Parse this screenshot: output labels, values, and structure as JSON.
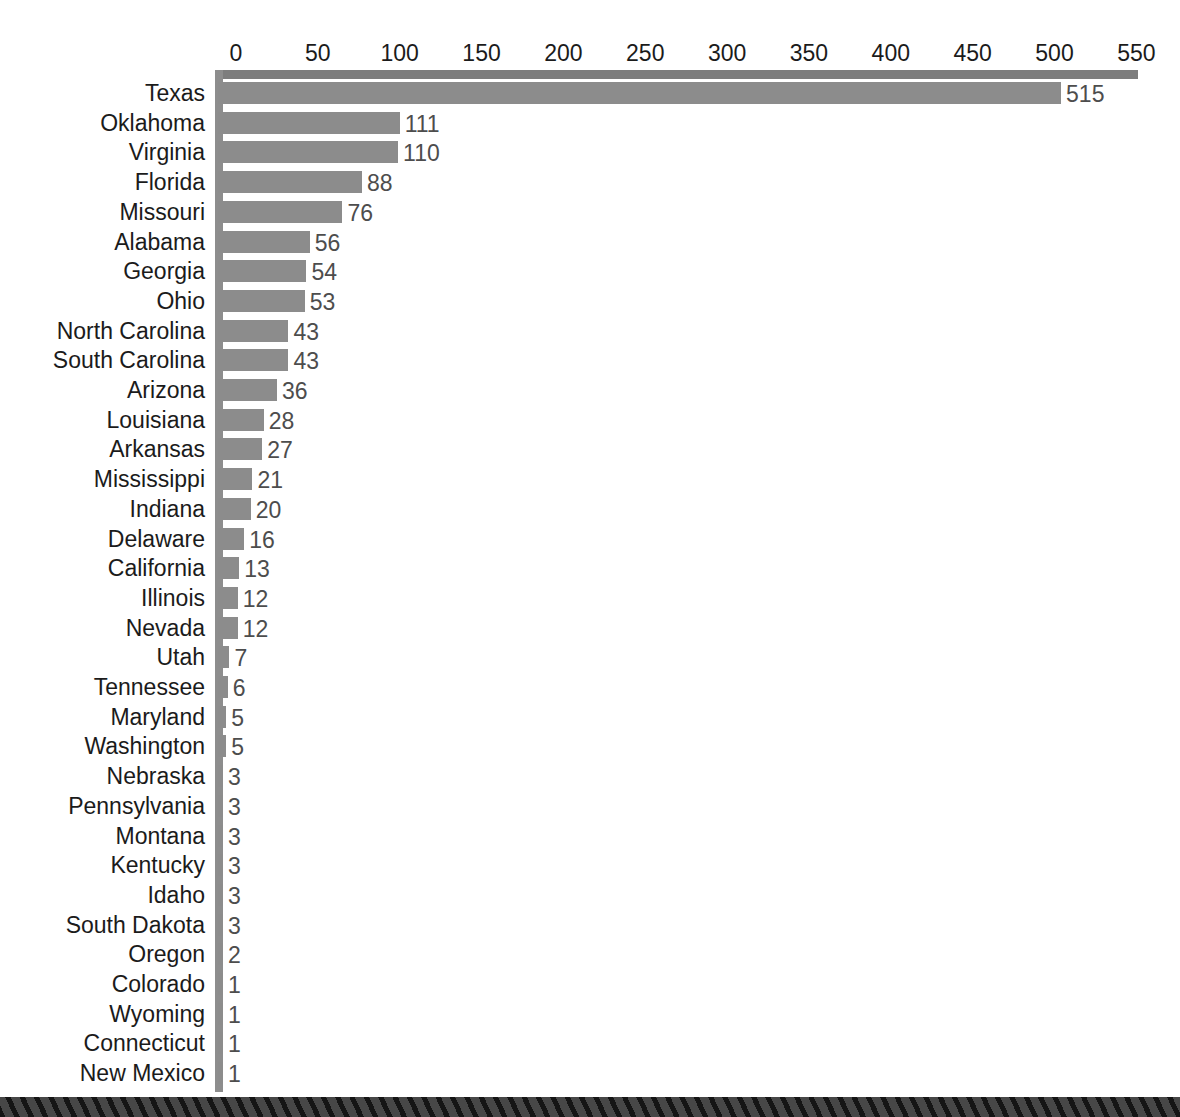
{
  "page": {
    "background_color": "#ffffff",
    "title_cropped": "",
    "footer_band_color": "#3b3b3b",
    "footer_band_stripe_color": "#151515"
  },
  "chart_data": {
    "type": "bar",
    "orientation": "horizontal",
    "title": "",
    "xlabel": "",
    "ylabel": "",
    "xlim": [
      0,
      550
    ],
    "grid": false,
    "legend": null,
    "bar_color": "#8c8c8c",
    "axis_color": "#7d7d7d",
    "value_label_color": "#4d4d4d",
    "tick_labels": [
      "0",
      "50",
      "100",
      "150",
      "200",
      "250",
      "300",
      "350",
      "400",
      "450",
      "500",
      "550"
    ],
    "tick_values": [
      0,
      50,
      100,
      150,
      200,
      250,
      300,
      350,
      400,
      450,
      500,
      550
    ],
    "categories": [
      "Texas",
      "Oklahoma",
      "Virginia",
      "Florida",
      "Missouri",
      "Alabama",
      "Georgia",
      "Ohio",
      "North Carolina",
      "South Carolina",
      "Arizona",
      "Louisiana",
      "Arkansas",
      "Mississippi",
      "Indiana",
      "Delaware",
      "California",
      "Illinois",
      "Nevada",
      "Utah",
      "Tennessee",
      "Maryland",
      "Washington",
      "Nebraska",
      "Pennsylvania",
      "Montana",
      "Kentucky",
      "Idaho",
      "South Dakota",
      "Oregon",
      "Colorado",
      "Wyoming",
      "Connecticut",
      "New Mexico"
    ],
    "values": [
      515,
      111,
      110,
      88,
      76,
      56,
      54,
      53,
      43,
      43,
      36,
      28,
      27,
      21,
      20,
      16,
      13,
      12,
      12,
      7,
      6,
      5,
      5,
      3,
      3,
      3,
      3,
      3,
      3,
      2,
      1,
      1,
      1,
      1
    ],
    "value_labels": [
      "515",
      "111",
      "110",
      "88",
      "76",
      "56",
      "54",
      "53",
      "43",
      "43",
      "36",
      "28",
      "27",
      "21",
      "20",
      "16",
      "13",
      "12",
      "12",
      "7",
      "6",
      "5",
      "5",
      "3",
      "3",
      "3",
      "3",
      "3",
      "3",
      "2",
      "1",
      "1",
      "1",
      "1"
    ]
  }
}
